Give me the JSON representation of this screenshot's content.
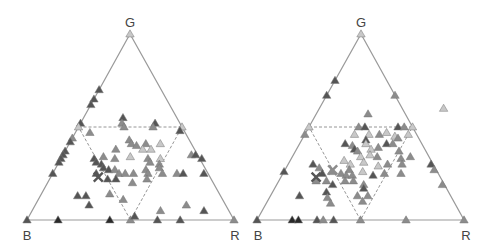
{
  "chart_data": [
    {
      "type": "scatter",
      "subtype": "ternary",
      "title": "",
      "vertex_labels": {
        "top": "G",
        "left": "B",
        "right": "R"
      },
      "inner_triangle": "dashed inverted triangle joining edge midpoints",
      "marker": "triangle",
      "points": [
        {
          "r": 0.0,
          "g": 1.0,
          "b": 0.0,
          "shade": "light"
        },
        {
          "r": 0.0,
          "g": 0.7,
          "b": 0.3,
          "shade": "dark"
        },
        {
          "r": 0.0,
          "g": 0.65,
          "b": 0.35,
          "shade": "dark"
        },
        {
          "r": 0.0,
          "g": 0.62,
          "b": 0.38,
          "shade": "dark"
        },
        {
          "r": 0.19,
          "g": 0.55,
          "b": 0.26,
          "shade": "dark"
        },
        {
          "r": 0.2,
          "g": 0.52,
          "b": 0.28,
          "shade": "mid"
        },
        {
          "r": 0.0,
          "g": 0.52,
          "b": 0.48,
          "shade": "dark"
        },
        {
          "r": 0.0,
          "g": 0.5,
          "b": 0.5,
          "shade": "light"
        },
        {
          "r": 0.07,
          "g": 0.47,
          "b": 0.46,
          "shade": "mid"
        },
        {
          "r": 0.22,
          "g": 0.5,
          "b": 0.28,
          "shade": "mid"
        },
        {
          "r": 0.36,
          "g": 0.52,
          "b": 0.12,
          "shade": "dark"
        },
        {
          "r": 0.36,
          "g": 0.5,
          "b": 0.14,
          "shade": "mid"
        },
        {
          "r": 0.5,
          "g": 0.5,
          "b": 0.0,
          "shade": "light"
        },
        {
          "r": 0.5,
          "g": 0.48,
          "b": 0.02,
          "shade": "dark"
        },
        {
          "r": 0.0,
          "g": 0.44,
          "b": 0.56,
          "shade": "mid"
        },
        {
          "r": 0.0,
          "g": 0.42,
          "b": 0.58,
          "shade": "dark"
        },
        {
          "r": 0.0,
          "g": 0.37,
          "b": 0.63,
          "shade": "dark"
        },
        {
          "r": 0.0,
          "g": 0.35,
          "b": 0.65,
          "shade": "dark"
        },
        {
          "r": 0.0,
          "g": 0.33,
          "b": 0.67,
          "shade": "dark"
        },
        {
          "r": 0.0,
          "g": 0.31,
          "b": 0.69,
          "shade": "dark"
        },
        {
          "r": 0.0,
          "g": 0.25,
          "b": 0.75,
          "shade": "dark"
        },
        {
          "r": 0.28,
          "g": 0.43,
          "b": 0.29,
          "shade": "mid"
        },
        {
          "r": 0.3,
          "g": 0.41,
          "b": 0.29,
          "shade": "mid"
        },
        {
          "r": 0.33,
          "g": 0.4,
          "b": 0.27,
          "shade": "mid"
        },
        {
          "r": 0.37,
          "g": 0.41,
          "b": 0.22,
          "shade": "mid"
        },
        {
          "r": 0.37,
          "g": 0.38,
          "b": 0.25,
          "shade": "light"
        },
        {
          "r": 0.41,
          "g": 0.38,
          "b": 0.21,
          "shade": "light"
        },
        {
          "r": 0.24,
          "g": 0.38,
          "b": 0.38,
          "shade": "mid"
        },
        {
          "r": 0.2,
          "g": 0.34,
          "b": 0.46,
          "shade": "mid"
        },
        {
          "r": 0.26,
          "g": 0.33,
          "b": 0.41,
          "shade": "mid"
        },
        {
          "r": 0.33,
          "g": 0.34,
          "b": 0.33,
          "shade": "light"
        },
        {
          "r": 0.44,
          "g": 0.41,
          "b": 0.15,
          "shade": "light"
        },
        {
          "r": 0.42,
          "g": 0.33,
          "b": 0.25,
          "shade": "mid"
        },
        {
          "r": 0.44,
          "g": 0.31,
          "b": 0.25,
          "shade": "mid"
        },
        {
          "r": 0.48,
          "g": 0.33,
          "b": 0.19,
          "shade": "light"
        },
        {
          "r": 0.49,
          "g": 0.3,
          "b": 0.21,
          "shade": "mid"
        },
        {
          "r": 0.16,
          "g": 0.33,
          "b": 0.51,
          "shade": "dark"
        },
        {
          "r": 0.18,
          "g": 0.31,
          "b": 0.51,
          "shade": "dark"
        },
        {
          "r": 0.21,
          "g": 0.3,
          "b": 0.49,
          "shade": "dark"
        },
        {
          "r": 0.23,
          "g": 0.28,
          "b": 0.49,
          "shade": "dark"
        },
        {
          "r": 0.26,
          "g": 0.27,
          "b": 0.47,
          "shade": "dark"
        },
        {
          "r": 0.29,
          "g": 0.27,
          "b": 0.44,
          "shade": "mid"
        },
        {
          "r": 0.32,
          "g": 0.25,
          "b": 0.43,
          "shade": "mid"
        },
        {
          "r": 0.35,
          "g": 0.25,
          "b": 0.4,
          "shade": "mid"
        },
        {
          "r": 0.39,
          "g": 0.25,
          "b": 0.36,
          "shade": "mid"
        },
        {
          "r": 0.44,
          "g": 0.27,
          "b": 0.29,
          "shade": "mid"
        },
        {
          "r": 0.46,
          "g": 0.25,
          "b": 0.29,
          "shade": "mid"
        },
        {
          "r": 0.5,
          "g": 0.28,
          "b": 0.22,
          "shade": "mid"
        },
        {
          "r": 0.53,
          "g": 0.25,
          "b": 0.22,
          "shade": "mid"
        },
        {
          "r": 0.21,
          "g": 0.25,
          "b": 0.54,
          "shade": "dark"
        },
        {
          "r": 0.28,
          "g": 0.22,
          "b": 0.5,
          "shade": "dark"
        },
        {
          "r": 0.32,
          "g": 0.22,
          "b": 0.46,
          "shade": "dark"
        },
        {
          "r": 0.41,
          "g": 0.2,
          "b": 0.39,
          "shade": "mid"
        },
        {
          "r": 0.47,
          "g": 0.22,
          "b": 0.31,
          "shade": "mid"
        },
        {
          "r": 0.62,
          "g": 0.35,
          "b": 0.03,
          "shade": "mid"
        },
        {
          "r": 0.64,
          "g": 0.35,
          "b": 0.01,
          "shade": "dark"
        },
        {
          "r": 0.68,
          "g": 0.33,
          "b": 0.0,
          "shade": "dark"
        },
        {
          "r": 0.6,
          "g": 0.25,
          "b": 0.15,
          "shade": "mid"
        },
        {
          "r": 0.63,
          "g": 0.25,
          "b": 0.12,
          "shade": "dark"
        },
        {
          "r": 0.73,
          "g": 0.25,
          "b": 0.02,
          "shade": "dark"
        },
        {
          "r": 0.22,
          "g": 0.13,
          "b": 0.65,
          "shade": "dark"
        },
        {
          "r": 0.33,
          "g": 0.14,
          "b": 0.53,
          "shade": "mid"
        },
        {
          "r": 0.41,
          "g": 0.11,
          "b": 0.48,
          "shade": "mid"
        },
        {
          "r": 0.26,
          "g": 0.08,
          "b": 0.66,
          "shade": "dark"
        },
        {
          "r": 0.18,
          "g": 0.13,
          "b": 0.69,
          "shade": "dark"
        },
        {
          "r": 0.5,
          "g": 0.0,
          "b": 0.5,
          "shade": "mid"
        },
        {
          "r": 0.51,
          "g": 0.02,
          "b": 0.47,
          "shade": "dark"
        },
        {
          "r": 0.62,
          "g": 0.05,
          "b": 0.33,
          "shade": "mid"
        },
        {
          "r": 0.73,
          "g": 0.08,
          "b": 0.19,
          "shade": "mid"
        },
        {
          "r": 0.83,
          "g": 0.05,
          "b": 0.12,
          "shade": "dark"
        },
        {
          "r": 0.0,
          "g": 0.0,
          "b": 1.0,
          "shade": "dark"
        },
        {
          "r": 0.15,
          "g": 0.0,
          "b": 0.85,
          "shade": "black"
        },
        {
          "r": 0.4,
          "g": 0.0,
          "b": 0.6,
          "shade": "black"
        },
        {
          "r": 0.63,
          "g": 0.0,
          "b": 0.37,
          "shade": "dark"
        },
        {
          "r": 0.74,
          "g": 0.0,
          "b": 0.26,
          "shade": "dark"
        },
        {
          "r": 1.0,
          "g": 0.0,
          "b": 0.0,
          "shade": "mid"
        }
      ],
      "crosses": [
        {
          "r": 0.23,
          "g": 0.23,
          "b": 0.54,
          "shade": "dark"
        }
      ]
    },
    {
      "type": "scatter",
      "subtype": "ternary",
      "title": "",
      "vertex_labels": {
        "top": "G",
        "left": "B",
        "right": "R"
      },
      "inner_triangle": "dashed inverted triangle joining edge midpoints",
      "marker": "triangle",
      "points": [
        {
          "r": 0.0,
          "g": 1.0,
          "b": 0.0,
          "shade": "light"
        },
        {
          "r": 0.0,
          "g": 0.75,
          "b": 0.25,
          "shade": "dark"
        },
        {
          "r": 0.0,
          "g": 0.67,
          "b": 0.33,
          "shade": "dark"
        },
        {
          "r": 0.33,
          "g": 0.67,
          "b": 0.0,
          "shade": "mid"
        },
        {
          "r": 0.6,
          "g": 0.6,
          "b": -0.2,
          "shade": "light"
        },
        {
          "r": 0.25,
          "g": 0.57,
          "b": 0.18,
          "shade": "mid"
        },
        {
          "r": 0.0,
          "g": 0.5,
          "b": 0.5,
          "shade": "light"
        },
        {
          "r": 0.0,
          "g": 0.46,
          "b": 0.54,
          "shade": "mid"
        },
        {
          "r": 0.24,
          "g": 0.5,
          "b": 0.26,
          "shade": "mid"
        },
        {
          "r": 0.27,
          "g": 0.5,
          "b": 0.23,
          "shade": "dark"
        },
        {
          "r": 0.43,
          "g": 0.5,
          "b": 0.07,
          "shade": "dark"
        },
        {
          "r": 0.46,
          "g": 0.5,
          "b": 0.04,
          "shade": "mid"
        },
        {
          "r": 0.5,
          "g": 0.5,
          "b": 0.0,
          "shade": "light"
        },
        {
          "r": 0.5,
          "g": 0.46,
          "b": 0.04,
          "shade": "light"
        },
        {
          "r": 0.24,
          "g": 0.46,
          "b": 0.3,
          "shade": "light"
        },
        {
          "r": 0.31,
          "g": 0.46,
          "b": 0.23,
          "shade": "light"
        },
        {
          "r": 0.36,
          "g": 0.46,
          "b": 0.18,
          "shade": "mid"
        },
        {
          "r": 0.39,
          "g": 0.47,
          "b": 0.14,
          "shade": "light"
        },
        {
          "r": 0.44,
          "g": 0.45,
          "b": 0.11,
          "shade": "light"
        },
        {
          "r": 0.46,
          "g": 0.44,
          "b": 0.1,
          "shade": "mid"
        },
        {
          "r": 0.31,
          "g": 0.43,
          "b": 0.26,
          "shade": "dark"
        },
        {
          "r": 0.32,
          "g": 0.41,
          "b": 0.27,
          "shade": "light"
        },
        {
          "r": 0.22,
          "g": 0.41,
          "b": 0.37,
          "shade": "dark"
        },
        {
          "r": 0.26,
          "g": 0.4,
          "b": 0.34,
          "shade": "mid"
        },
        {
          "r": 0.28,
          "g": 0.38,
          "b": 0.34,
          "shade": "dark"
        },
        {
          "r": 0.3,
          "g": 0.37,
          "b": 0.33,
          "shade": "mid"
        },
        {
          "r": 0.36,
          "g": 0.38,
          "b": 0.26,
          "shade": "light"
        },
        {
          "r": 0.39,
          "g": 0.39,
          "b": 0.22,
          "shade": "mid"
        },
        {
          "r": 0.42,
          "g": 0.41,
          "b": 0.17,
          "shade": "dark"
        },
        {
          "r": 0.45,
          "g": 0.41,
          "b": 0.14,
          "shade": "mid"
        },
        {
          "r": 0.33,
          "g": 0.34,
          "b": 0.33,
          "shade": "light"
        },
        {
          "r": 0.37,
          "g": 0.35,
          "b": 0.28,
          "shade": "light"
        },
        {
          "r": 0.41,
          "g": 0.34,
          "b": 0.25,
          "shade": "mid"
        },
        {
          "r": 0.5,
          "g": 0.37,
          "b": 0.13,
          "shade": "mid"
        },
        {
          "r": 0.53,
          "g": 0.33,
          "b": 0.14,
          "shade": "mid"
        },
        {
          "r": 0.57,
          "g": 0.34,
          "b": 0.09,
          "shade": "mid"
        },
        {
          "r": 0.69,
          "g": 0.3,
          "b": 0.01,
          "shade": "dark"
        },
        {
          "r": 0.72,
          "g": 0.27,
          "b": 0.01,
          "shade": "mid"
        },
        {
          "r": 0.12,
          "g": 0.3,
          "b": 0.58,
          "shade": "dark"
        },
        {
          "r": 0.16,
          "g": 0.28,
          "b": 0.56,
          "shade": "mid"
        },
        {
          "r": 0.26,
          "g": 0.32,
          "b": 0.42,
          "shade": "light"
        },
        {
          "r": 0.3,
          "g": 0.3,
          "b": 0.4,
          "shade": "light"
        },
        {
          "r": 0.36,
          "g": 0.31,
          "b": 0.33,
          "shade": "light"
        },
        {
          "r": 0.44,
          "g": 0.29,
          "b": 0.27,
          "shade": "light"
        },
        {
          "r": 0.48,
          "g": 0.3,
          "b": 0.22,
          "shade": "mid"
        },
        {
          "r": 0.55,
          "g": 0.3,
          "b": 0.15,
          "shade": "mid"
        },
        {
          "r": 0.19,
          "g": 0.25,
          "b": 0.56,
          "shade": "dark"
        },
        {
          "r": 0.23,
          "g": 0.26,
          "b": 0.51,
          "shade": "mid"
        },
        {
          "r": 0.28,
          "g": 0.25,
          "b": 0.47,
          "shade": "mid"
        },
        {
          "r": 0.31,
          "g": 0.27,
          "b": 0.42,
          "shade": "mid"
        },
        {
          "r": 0.31,
          "g": 0.24,
          "b": 0.45,
          "shade": "mid"
        },
        {
          "r": 0.34,
          "g": 0.24,
          "b": 0.42,
          "shade": "mid"
        },
        {
          "r": 0.38,
          "g": 0.26,
          "b": 0.36,
          "shade": "light"
        },
        {
          "r": 0.44,
          "g": 0.24,
          "b": 0.32,
          "shade": "dark"
        },
        {
          "r": 0.49,
          "g": 0.25,
          "b": 0.26,
          "shade": "mid"
        },
        {
          "r": 0.57,
          "g": 0.25,
          "b": 0.18,
          "shade": "mid"
        },
        {
          "r": 0.18,
          "g": 0.21,
          "b": 0.61,
          "shade": "mid"
        },
        {
          "r": 0.23,
          "g": 0.21,
          "b": 0.56,
          "shade": "mid"
        },
        {
          "r": 0.27,
          "g": 0.19,
          "b": 0.54,
          "shade": "dark"
        },
        {
          "r": 0.32,
          "g": 0.21,
          "b": 0.47,
          "shade": "mid"
        },
        {
          "r": 0.36,
          "g": 0.21,
          "b": 0.43,
          "shade": "mid"
        },
        {
          "r": 0.42,
          "g": 0.19,
          "b": 0.39,
          "shade": "mid"
        },
        {
          "r": 0.26,
          "g": 0.15,
          "b": 0.59,
          "shade": "dark"
        },
        {
          "r": 0.28,
          "g": 0.12,
          "b": 0.6,
          "shade": "mid"
        },
        {
          "r": 0.31,
          "g": 0.09,
          "b": 0.6,
          "shade": "mid"
        },
        {
          "r": 0.43,
          "g": 0.17,
          "b": 0.4,
          "shade": "dark"
        },
        {
          "r": 0.42,
          "g": 0.13,
          "b": 0.45,
          "shade": "mid"
        },
        {
          "r": 0.47,
          "g": 0.13,
          "b": 0.4,
          "shade": "mid"
        },
        {
          "r": 0.46,
          "g": 0.1,
          "b": 0.44,
          "shade": "mid"
        },
        {
          "r": 0.14,
          "g": 0.13,
          "b": 0.73,
          "shade": "dark"
        },
        {
          "r": 0.0,
          "g": 0.26,
          "b": 0.74,
          "shade": "dark"
        },
        {
          "r": 0.8,
          "g": 0.19,
          "b": 0.01,
          "shade": "mid"
        },
        {
          "r": 0.0,
          "g": 0.0,
          "b": 1.0,
          "shade": "dark"
        },
        {
          "r": 0.17,
          "g": 0.0,
          "b": 0.83,
          "shade": "black"
        },
        {
          "r": 0.2,
          "g": 0.0,
          "b": 0.8,
          "shade": "black"
        },
        {
          "r": 0.29,
          "g": 0.0,
          "b": 0.71,
          "shade": "dark"
        },
        {
          "r": 0.32,
          "g": 0.0,
          "b": 0.68,
          "shade": "mid"
        },
        {
          "r": 0.37,
          "g": 0.0,
          "b": 0.63,
          "shade": "dark"
        },
        {
          "r": 0.5,
          "g": 0.0,
          "b": 0.5,
          "shade": "mid"
        },
        {
          "r": 0.72,
          "g": 0.0,
          "b": 0.28,
          "shade": "mid"
        },
        {
          "r": 1.0,
          "g": 0.0,
          "b": 0.0,
          "shade": "mid"
        }
      ],
      "crosses": [
        {
          "r": 0.23,
          "g": 0.27,
          "b": 0.5,
          "shade": "mid"
        },
        {
          "r": 0.17,
          "g": 0.23,
          "b": 0.6,
          "shade": "dark"
        }
      ]
    }
  ],
  "shades": {
    "black": "#2a2a2a",
    "dark": "#555555",
    "mid": "#8c8c8c",
    "light": "#c8c8c8"
  },
  "colors": {
    "frame": "#9a9a9a",
    "dashed": "#8a8a8a",
    "label": "#444444"
  }
}
